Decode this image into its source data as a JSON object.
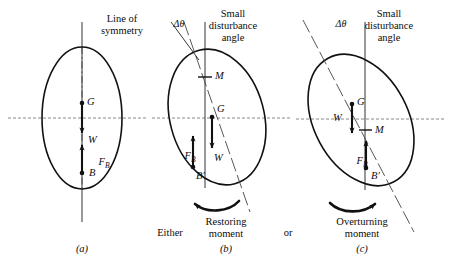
{
  "figure": {
    "title_a": "Line of\nsymmetry",
    "title_b": "Small\ndisturbance\nangle",
    "title_c": "Small\ndisturbance\nangle",
    "delta_theta_b": "Δθ",
    "delta_theta_c": "Δθ",
    "caption_a": "(a)",
    "caption_b": "(b)",
    "caption_c": "(c)",
    "either": "Either",
    "or": "or",
    "moment_b": "Restoring\nmoment",
    "moment_c": "Overturning\nmoment"
  },
  "panel_a": {
    "label_G": "G",
    "label_W": "W",
    "label_FB": "F",
    "label_FB_sub": "B",
    "label_B": "B"
  },
  "panel_b": {
    "label_M": "M",
    "label_G": "G",
    "label_W": "W",
    "label_FB": "F",
    "label_FB_sub": "B",
    "label_Bp": "B′"
  },
  "panel_c": {
    "label_G": "G",
    "label_W": "W",
    "label_M": "M",
    "label_FB": "F",
    "label_FB_sub": "B",
    "label_Bp": "B′"
  },
  "colors": {
    "ink": "#111111",
    "waterline": "#7a7a7a",
    "background": "#ffffff"
  }
}
